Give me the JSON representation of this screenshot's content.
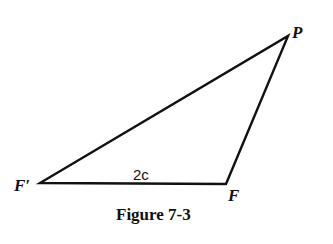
{
  "diagram": {
    "type": "triangle",
    "vertices": [
      {
        "id": "F_prime",
        "label": "F′",
        "x": 40,
        "y": 183
      },
      {
        "id": "F",
        "label": "F",
        "x": 226,
        "y": 184
      },
      {
        "id": "P",
        "label": "P",
        "x": 288,
        "y": 36
      }
    ],
    "edges": [
      {
        "from": "F_prime",
        "to": "F",
        "label": "2c"
      },
      {
        "from": "F",
        "to": "P",
        "label": ""
      },
      {
        "from": "P",
        "to": "F_prime",
        "label": ""
      }
    ],
    "labels": {
      "p": "P",
      "f": "F",
      "f_prime": "F′",
      "base_length": "2c"
    },
    "caption": "Figure 7-3",
    "stroke_color": "#111111"
  }
}
